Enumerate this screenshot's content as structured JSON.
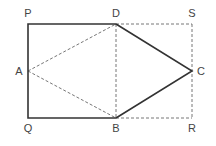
{
  "diagram": {
    "points": {
      "P": {
        "label": "P",
        "x": 28,
        "y": 24
      },
      "D": {
        "label": "D",
        "x": 116,
        "y": 24
      },
      "S": {
        "label": "S",
        "x": 192,
        "y": 24
      },
      "A": {
        "label": "A",
        "x": 28,
        "y": 71
      },
      "C": {
        "label": "C",
        "x": 192,
        "y": 71
      },
      "Q": {
        "label": "Q",
        "x": 28,
        "y": 118
      },
      "B": {
        "label": "B",
        "x": 116,
        "y": 118
      },
      "R": {
        "label": "R",
        "x": 192,
        "y": 118
      }
    },
    "solid_segments": [
      "PD",
      "PQ",
      "QB",
      "DC",
      "CB"
    ],
    "dashed_segments": [
      "DS",
      "SR",
      "BR",
      "DB",
      "AD",
      "AB"
    ],
    "colors": {
      "solid": "#333333",
      "dashed": "#777777",
      "label": "#444444"
    }
  }
}
